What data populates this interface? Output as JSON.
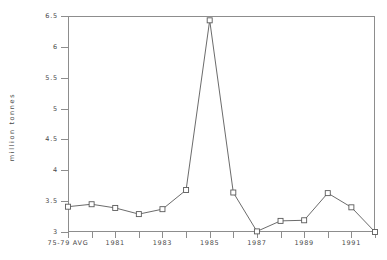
{
  "chart_data": {
    "type": "line",
    "title": "",
    "subtitle": "",
    "xlabel": "",
    "ylabel": "million tonnes",
    "ylim": [
      3,
      6.5
    ],
    "yticks": [
      3,
      3.5,
      4,
      4.5,
      5,
      5.5,
      6,
      6.5
    ],
    "ytick_labels": [
      "3",
      "3.5",
      "4",
      "4.5",
      "5",
      "5.5",
      "6",
      "6.5"
    ],
    "grid": false,
    "legend": null,
    "legend_position": "none",
    "categories": [
      "75-79 AVG",
      "1980",
      "1981",
      "1982",
      "1983",
      "1984",
      "1985",
      "1986",
      "1987",
      "1988",
      "1989",
      "1990",
      "1991",
      "1992"
    ],
    "xtick_labels_shown": [
      "75-79 AVG",
      "1981",
      "1983",
      "1985",
      "1987",
      "1989",
      "1991"
    ],
    "series": [
      {
        "name": "million tonnes",
        "marker": "open-square",
        "color": "#5a5a5a",
        "values": [
          3.41,
          3.45,
          3.39,
          3.29,
          3.37,
          3.68,
          6.43,
          3.64,
          3.01,
          3.18,
          3.19,
          3.63,
          3.4,
          3.0
        ]
      }
    ],
    "annotations": []
  },
  "axes": {
    "y_title": "million tonnes",
    "y_ticks": [
      {
        "label": "6.5",
        "value": 6.5
      },
      {
        "label": "6",
        "value": 6.0
      },
      {
        "label": "5.5",
        "value": 5.5
      },
      {
        "label": "5",
        "value": 5.0
      },
      {
        "label": "4.5",
        "value": 4.5
      },
      {
        "label": "4",
        "value": 4.0
      },
      {
        "label": "3.5",
        "value": 3.5
      },
      {
        "label": "3",
        "value": 3.0
      }
    ],
    "x_ticks": [
      {
        "label": "75-79 AVG",
        "index": 0
      },
      {
        "label": "",
        "index": 1
      },
      {
        "label": "1981",
        "index": 2
      },
      {
        "label": "",
        "index": 3
      },
      {
        "label": "1983",
        "index": 4
      },
      {
        "label": "",
        "index": 5
      },
      {
        "label": "1985",
        "index": 6
      },
      {
        "label": "",
        "index": 7
      },
      {
        "label": "1987",
        "index": 8
      },
      {
        "label": "",
        "index": 9
      },
      {
        "label": "1989",
        "index": 10
      },
      {
        "label": "",
        "index": 11
      },
      {
        "label": "1991",
        "index": 12
      },
      {
        "label": "",
        "index": 13
      }
    ]
  },
  "colors": {
    "background": "#ffffff",
    "axis": "#8d8d8d",
    "text": "#4a4a4a",
    "line": "#5a5a5a",
    "marker_fill": "#ffffff"
  }
}
